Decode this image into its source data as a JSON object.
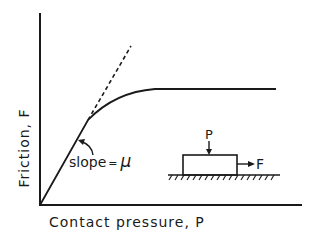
{
  "figure": {
    "y_axis_label": "Friction, F",
    "x_axis_label": "Contact pressure, P",
    "slope_label": "slope = μ",
    "slope_text": "slope",
    "slope_eq": "=",
    "slope_symbol": "μ",
    "inset": {
      "load_label": "P",
      "force_label": "F"
    }
  },
  "colors": {
    "ink": "#1a1a1a",
    "background": "#ffffff"
  }
}
